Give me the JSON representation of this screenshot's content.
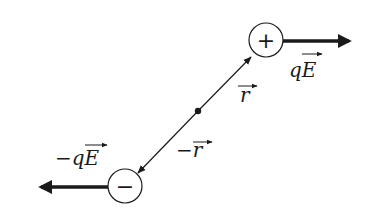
{
  "diagram": {
    "colors": {
      "ink": "#1a1a1a",
      "background": "#ffffff"
    },
    "charges": [
      {
        "name": "positive",
        "symbol": "+",
        "cx": 266,
        "cy": 40,
        "r": 17
      },
      {
        "name": "negative",
        "symbol": "−",
        "cx": 125,
        "cy": 186,
        "r": 17
      }
    ],
    "center_point": {
      "cx": 198,
      "cy": 111
    },
    "labels": {
      "force_positive": "qE",
      "force_negative": "−qE",
      "r_vector": "r",
      "minus_r_vector": "−r"
    }
  }
}
